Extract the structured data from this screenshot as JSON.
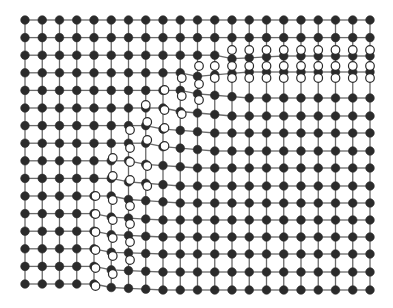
{
  "figure": {
    "title": "",
    "colors": {
      "background": "#ffffff",
      "atom": "#2b2b2b",
      "bond": "#6a6a6a",
      "open_fill": "#ffffff"
    },
    "lattice": {
      "columns": 21,
      "x_start": 25,
      "x_spacing": 17.25,
      "rows_left": 16,
      "y_start": 20,
      "y_spacing_left": 17.6,
      "y_spacing_right": 17.4,
      "atom_radius": 4.3
    },
    "boundary": {
      "description": "Step-shaped boundary running from upper right (column ~12, row 3) to lower left (column ~5, row 15)",
      "steps": [
        {
          "row_from": 2,
          "row_to": 4,
          "col_start": 12,
          "open_rows_y": [
            50,
            66,
            78
          ]
        },
        {
          "row_from": 4,
          "row_to": 7,
          "col_start": 8
        },
        {
          "row_from": 7,
          "row_to": 11,
          "col_start": 6
        },
        {
          "row_from": 11,
          "row_to": 16,
          "col_start": 5
        }
      ]
    },
    "legend": []
  }
}
